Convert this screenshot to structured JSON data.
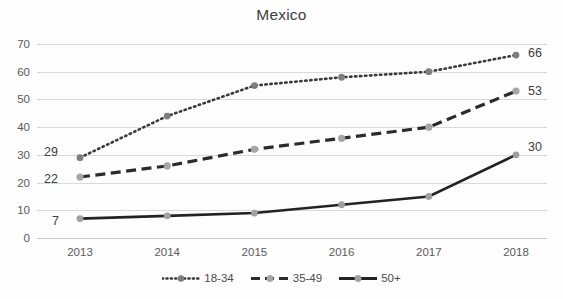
{
  "chart_data": {
    "type": "line",
    "title": "Mexico",
    "xlabel": "",
    "ylabel": "",
    "categories": [
      "2013",
      "2014",
      "2015",
      "2016",
      "2017",
      "2018"
    ],
    "ylim": [
      0,
      70
    ],
    "yticks": [
      0,
      10,
      20,
      30,
      40,
      50,
      60,
      70
    ],
    "grid": true,
    "legend_position": "bottom",
    "series": [
      {
        "name": "18-34",
        "style": "dotted",
        "color": "#3a3a3a",
        "marker_color": "#7d7d7d",
        "values": [
          29,
          44,
          55,
          58,
          60,
          66
        ],
        "labels": {
          "first": "29",
          "last": "66"
        }
      },
      {
        "name": "35-49",
        "style": "dashed",
        "color": "#2b2b2b",
        "marker_color": "#a6a6a6",
        "values": [
          22,
          26,
          32,
          36,
          40,
          53
        ],
        "labels": {
          "first": "22",
          "last": "53"
        }
      },
      {
        "name": "50+",
        "style": "solid",
        "color": "#232323",
        "marker_color": "#a0a0a0",
        "values": [
          7,
          8,
          9,
          12,
          15,
          30
        ],
        "labels": {
          "first": "7",
          "last": "30"
        }
      }
    ],
    "annotations": [
      {
        "text": "29",
        "series": "18-34",
        "position": "left-of-first-point"
      },
      {
        "text": "22",
        "series": "35-49",
        "position": "left-of-first-point"
      },
      {
        "text": "7",
        "series": "50+",
        "position": "left-of-first-point"
      },
      {
        "text": "66",
        "series": "18-34",
        "position": "right-of-last-point"
      },
      {
        "text": "53",
        "series": "35-49",
        "position": "right-of-last-point"
      },
      {
        "text": "30",
        "series": "50+",
        "position": "right-of-last-point"
      }
    ]
  },
  "yticks": {
    "t0": "0",
    "t10": "10",
    "t20": "20",
    "t30": "30",
    "t40": "40",
    "t50": "50",
    "t60": "60",
    "t70": "70"
  },
  "xticks": {
    "x0": "2013",
    "x1": "2014",
    "x2": "2015",
    "x3": "2016",
    "x4": "2017",
    "x5": "2018"
  },
  "legend": {
    "items": [
      {
        "label": "18-34"
      },
      {
        "label": "35-49"
      },
      {
        "label": "50+"
      }
    ]
  },
  "value_labels": {
    "s1_first": "29",
    "s2_first": "22",
    "s3_first": "7",
    "s1_last": "66",
    "s2_last": "53",
    "s3_last": "30"
  },
  "colors": {
    "grid": "#d9d9d9",
    "text": "#5a5a5a",
    "title": "#3e3e3e",
    "series1": "#3a3a3a",
    "series2": "#2b2b2b",
    "series3": "#232323",
    "marker1": "#7d7d7d",
    "marker2": "#a6a6a6",
    "marker3": "#a0a0a0"
  }
}
